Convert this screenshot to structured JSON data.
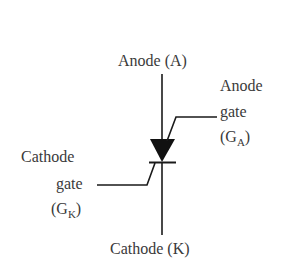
{
  "diagram": {
    "colors": {
      "stroke": "#1a1a1a",
      "text": "#3a3a3a",
      "background": "#ffffff"
    },
    "labels": {
      "anode": "Anode (A)",
      "anode_gate_line1": "Anode",
      "anode_gate_line2": "gate",
      "anode_gate_open": "(G",
      "anode_gate_sub": "A",
      "anode_gate_close": ")",
      "cathode_gate_line1": "Cathode",
      "cathode_gate_line2": "gate",
      "cathode_gate_open": "(G",
      "cathode_gate_sub": "K",
      "cathode_gate_close": ")",
      "cathode": "Cathode (K)"
    },
    "terminals": [
      "Anode (A)",
      "Anode gate (GA)",
      "Cathode gate (GK)",
      "Cathode (K)"
    ]
  }
}
